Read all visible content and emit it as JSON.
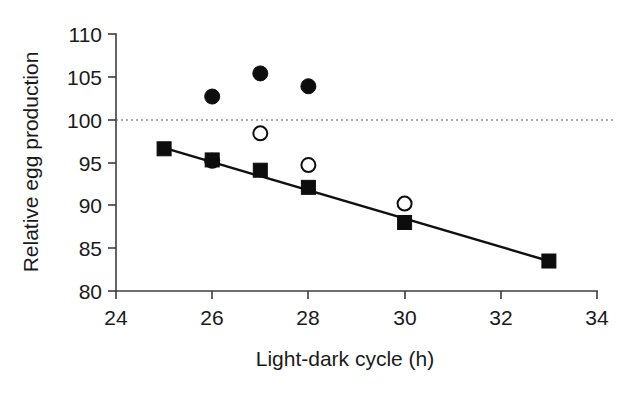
{
  "chart_data": {
    "type": "scatter",
    "title": "",
    "xlabel": "Light-dark cycle (h)",
    "ylabel": "Relative egg production",
    "xlim": [
      24,
      34
    ],
    "ylim": [
      80,
      110
    ],
    "xticks": [
      24,
      26,
      28,
      30,
      32,
      34
    ],
    "yticks": [
      80,
      85,
      90,
      95,
      100,
      105,
      110
    ],
    "grid": false,
    "legend_position": "none",
    "reference_line": {
      "y": 100,
      "style": "dotted"
    },
    "series": [
      {
        "name": "filled-circle-series",
        "marker": "filled-circle",
        "points": [
          {
            "x": 26,
            "y": 102.7
          },
          {
            "x": 27,
            "y": 105.4
          },
          {
            "x": 28,
            "y": 103.9
          }
        ]
      },
      {
        "name": "open-circle-series",
        "marker": "open-circle",
        "points": [
          {
            "x": 26,
            "y": 95.2
          },
          {
            "x": 27,
            "y": 98.4
          },
          {
            "x": 28,
            "y": 94.7
          },
          {
            "x": 30,
            "y": 90.2
          }
        ]
      },
      {
        "name": "filled-square-series",
        "marker": "filled-square",
        "trend_line": true,
        "points": [
          {
            "x": 25,
            "y": 96.6
          },
          {
            "x": 26,
            "y": 95.3
          },
          {
            "x": 27,
            "y": 94.1
          },
          {
            "x": 28,
            "y": 92.1
          },
          {
            "x": 30,
            "y": 88.0
          },
          {
            "x": 33,
            "y": 83.5
          }
        ],
        "fit": {
          "x1": 25,
          "y1": 96.7,
          "x2": 33,
          "y2": 83.5
        }
      }
    ],
    "ytick_labels": [
      "80",
      "85",
      "90",
      "95",
      "100",
      "105",
      "110"
    ],
    "xtick_labels": [
      "24",
      "26",
      "28",
      "30",
      "32",
      "34"
    ]
  }
}
